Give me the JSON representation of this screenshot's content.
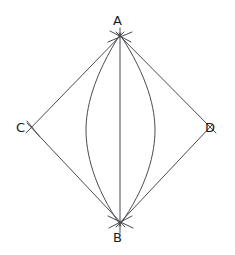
{
  "figure": {
    "type": "geometric-construction",
    "background_color": "#ffffff",
    "stroke_color": "#4a4a52",
    "label_color": "#1b1b1b",
    "canvas": {
      "width": 235,
      "height": 255
    }
  },
  "labels": {
    "A": "A",
    "B": "B",
    "C": "C",
    "D": "D"
  },
  "points": {
    "A": {
      "name": "A",
      "x": 120,
      "y": 37
    },
    "B": {
      "name": "B",
      "x": 120,
      "y": 222
    },
    "C": {
      "name": "C",
      "x": 32,
      "y": 128
    },
    "D": {
      "name": "D",
      "x": 210,
      "y": 128
    }
  },
  "segments": [
    {
      "name": "segment-A-C",
      "from": "A",
      "to": "C"
    },
    {
      "name": "segment-A-D",
      "from": "A",
      "to": "D"
    },
    {
      "name": "segment-C-B",
      "from": "C",
      "to": "B"
    },
    {
      "name": "segment-D-B",
      "from": "D",
      "to": "B"
    },
    {
      "name": "segment-A-B",
      "from": "A",
      "to": "B"
    }
  ],
  "arcs": [
    {
      "name": "arc-left",
      "from": "A",
      "to": "B",
      "bulge_x": 86,
      "bulge_direction": "left"
    },
    {
      "name": "arc-right",
      "from": "A",
      "to": "B",
      "bulge_x": 155,
      "bulge_direction": "right"
    }
  ],
  "construction_marks": [
    {
      "name": "intersection-mark-A",
      "at": "A"
    },
    {
      "name": "intersection-mark-B",
      "at": "B"
    },
    {
      "name": "intersection-mark-C",
      "at": "C"
    },
    {
      "name": "intersection-mark-D",
      "at": "D"
    }
  ]
}
